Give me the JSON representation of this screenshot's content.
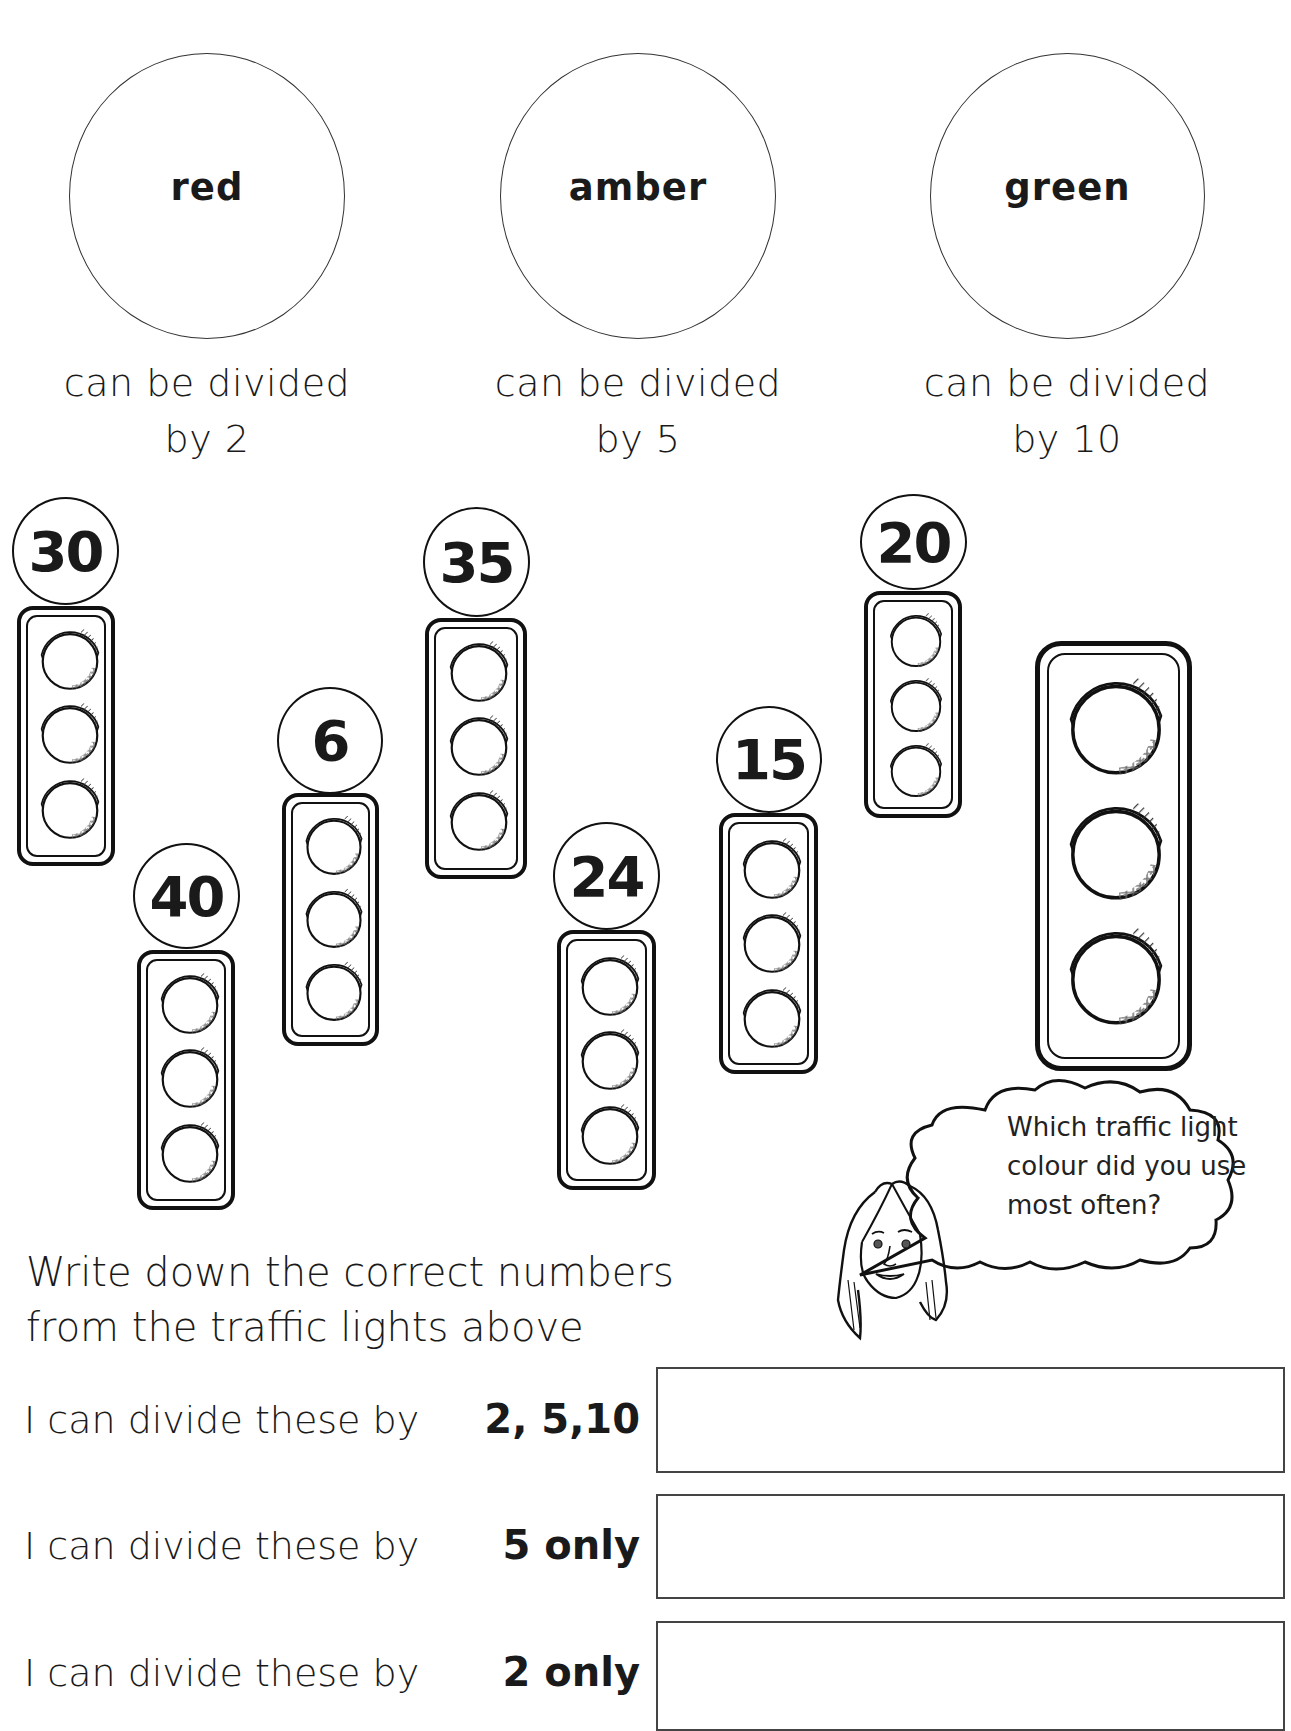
{
  "categories": [
    {
      "colour": "red",
      "description_line1": "can be divided",
      "description_line2": "by 2"
    },
    {
      "colour": "amber",
      "description_line1": "can be divided",
      "description_line2": "by 5"
    },
    {
      "colour": "green",
      "description_line1": "can be divided",
      "description_line2": "by 10"
    }
  ],
  "traffic_lights": [
    {
      "number": "30"
    },
    {
      "number": "40"
    },
    {
      "number": "6"
    },
    {
      "number": "35"
    },
    {
      "number": "24"
    },
    {
      "number": "15"
    },
    {
      "number": "20"
    }
  ],
  "speech_bubble": {
    "line1": "Which traffic light",
    "line2": "colour did you use",
    "line3": "most often?"
  },
  "instructions": {
    "line1": "Write down the correct numbers",
    "line2": "from the traffic lights above"
  },
  "answer_rows": [
    {
      "prompt": "I can divide these by",
      "divisor": "2, 5,10",
      "value": ""
    },
    {
      "prompt": "I can divide these by",
      "divisor": "5 only",
      "value": ""
    },
    {
      "prompt": "I can divide these by",
      "divisor": "2 only",
      "value": ""
    }
  ]
}
